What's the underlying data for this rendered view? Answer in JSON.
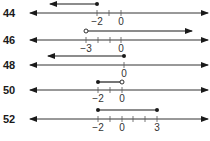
{
  "problems": [
    {
      "number": "44",
      "ray": {
        "type": "left",
        "endpoint": -2,
        "closed": true
      },
      "ticks": [
        -2,
        -1,
        0
      ],
      "labels": [
        {
          "text": "−2",
          "value": -2
        },
        {
          "text": "0",
          "value": 0
        }
      ]
    },
    {
      "number": "46",
      "ray": {
        "type": "right",
        "endpoint": -3,
        "closed": false
      },
      "ticks": [
        -3,
        -2,
        -1,
        0
      ],
      "labels": [
        {
          "text": "−3",
          "value": -3
        },
        {
          "text": "0",
          "value": 0
        }
      ]
    },
    {
      "number": "48",
      "ray": {
        "type": "left",
        "endpoint": 0,
        "closed": true
      },
      "ticks": [
        0
      ],
      "labels": [
        {
          "text": "0",
          "value": 0
        }
      ]
    },
    {
      "number": "50",
      "segment": {
        "start": -2,
        "start_closed": true,
        "end": 0,
        "end_closed": false
      },
      "ticks": [
        -2,
        -1,
        0
      ],
      "labels": [
        {
          "text": "−2",
          "value": -2
        },
        {
          "text": "0",
          "value": 0
        }
      ]
    },
    {
      "number": "52",
      "segment": {
        "start": -2,
        "start_closed": true,
        "end": 3,
        "end_closed": true
      },
      "ticks": [
        -2,
        -1,
        0,
        1,
        2,
        3
      ],
      "labels": [
        {
          "text": "−2",
          "value": -2
        },
        {
          "text": "0",
          "value": 0
        },
        {
          "text": "3",
          "value": 3
        }
      ]
    }
  ],
  "colors": {
    "ink": "#1a1a1a",
    "axis": "#333333",
    "background": "#ffffff"
  }
}
